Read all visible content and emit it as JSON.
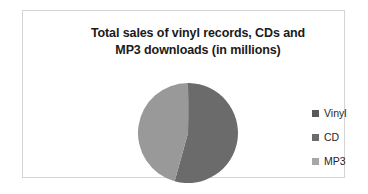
{
  "chart_data": {
    "type": "pie",
    "title": "Total sales of vinyl records, CDs and MP3 downloads (in millions)",
    "title_lines": [
      "Total sales of vinyl records, CDs and",
      "MP3 downloads (in millions)"
    ],
    "xlabel": "",
    "ylabel": "",
    "grid": false,
    "legend_position": "right",
    "categories": [
      "Vinyl",
      "CD",
      "MP3"
    ],
    "values": [
      0.3,
      54,
      45.7
    ],
    "slices": [
      {
        "label": "Vinyl",
        "value": 0.3,
        "percent": 0.3,
        "color": "#595959",
        "start_angle": 0,
        "end_angle": 1
      },
      {
        "label": "CD",
        "value": 54,
        "percent": 54,
        "color": "#6b6b6b",
        "start_angle": 1,
        "end_angle": 195
      },
      {
        "label": "MP3",
        "value": 45.7,
        "percent": 45.7,
        "color": "#999999",
        "start_angle": 195,
        "end_angle": 360
      }
    ],
    "colors": {
      "vinyl": "#595959",
      "cd": "#6b6b6b",
      "mp3": "#999999",
      "mp3_legend": "#a6a6a6",
      "border": "#d4d4d4",
      "background": "#ffffff",
      "title_text": "#1a1a1a",
      "legend_text": "#262626"
    }
  },
  "legend": {
    "items": [
      {
        "label": "Vinyl",
        "swatch": "#595959"
      },
      {
        "label": "CD",
        "swatch": "#6b6b6b"
      },
      {
        "label": "MP3",
        "swatch": "#a6a6a6"
      }
    ]
  }
}
